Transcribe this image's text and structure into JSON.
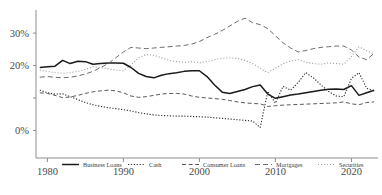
{
  "chart_data": {
    "type": "line",
    "title": "",
    "subtitle": "",
    "xlabel": "",
    "ylabel": "",
    "xlim": [
      1978.5,
      2023.5
    ],
    "ylim": [
      -8.5,
      36.5
    ],
    "grid": false,
    "legend_position": "bottom",
    "xticks": [
      1980,
      1990,
      2000,
      2010,
      2020
    ],
    "xticklabels": [
      "1980",
      "1990",
      "2000",
      "2010",
      "2020"
    ],
    "yticks": [
      0,
      10,
      20,
      30
    ],
    "yticklabels": [
      "0%",
      "",
      "20%",
      "30%"
    ],
    "x": [
      1979,
      1980,
      1981,
      1982,
      1983,
      1984,
      1985,
      1986,
      1987,
      1988,
      1989,
      1990,
      1991,
      1992,
      1993,
      1994,
      1995,
      1996,
      1997,
      1998,
      1999,
      2000,
      2001,
      2002,
      2003,
      2004,
      2005,
      2006,
      2007,
      2008,
      2009,
      2010,
      2011,
      2012,
      2013,
      2014,
      2015,
      2016,
      2017,
      2018,
      2019,
      2020,
      2021,
      2022,
      2023
    ],
    "series": [
      {
        "name": "Business Loans",
        "style": "solid",
        "color": "#1a1a1a",
        "values": [
          19.4,
          19.6,
          19.8,
          21.6,
          20.6,
          21.3,
          21.2,
          20.4,
          20.6,
          20.8,
          20.8,
          20.7,
          19.4,
          17.6,
          16.6,
          16.2,
          17.0,
          17.5,
          17.8,
          18.2,
          18.4,
          18.4,
          16.6,
          14.0,
          11.8,
          11.4,
          12.0,
          12.6,
          13.5,
          14.0,
          11.2,
          9.9,
          10.4,
          10.9,
          11.2,
          11.6,
          12.0,
          12.4,
          12.7,
          12.8,
          12.6,
          13.8,
          10.8,
          11.6,
          12.4
        ]
      },
      {
        "name": "Cash",
        "style": "dotted",
        "color": "#303030",
        "values": [
          12.4,
          11.6,
          11.2,
          11.3,
          10.4,
          9.5,
          8.6,
          7.9,
          7.4,
          7.0,
          6.7,
          6.4,
          6.0,
          5.5,
          5.1,
          4.8,
          4.6,
          4.5,
          4.4,
          4.4,
          4.3,
          4.2,
          4.1,
          3.9,
          3.7,
          3.5,
          3.3,
          3.1,
          2.9,
          0.9,
          12.0,
          8.4,
          13.6,
          12.4,
          14.8,
          17.8,
          16.2,
          14.0,
          12.0,
          10.6,
          10.4,
          16.0,
          17.8,
          13.0,
          12.2
        ]
      },
      {
        "name": "Consumer Loans",
        "style": "dashed",
        "color": "#5a5a5a",
        "values": [
          11.6,
          11.4,
          10.8,
          10.1,
          10.3,
          10.8,
          11.4,
          11.9,
          12.2,
          12.4,
          12.2,
          11.6,
          10.6,
          10.2,
          10.4,
          10.8,
          11.2,
          11.4,
          11.4,
          11.2,
          10.6,
          10.2,
          10.0,
          9.8,
          9.6,
          9.2,
          8.8,
          8.5,
          8.3,
          8.2,
          7.4,
          7.6,
          7.8,
          7.9,
          8.0,
          8.1,
          8.2,
          8.3,
          8.4,
          8.5,
          8.8,
          8.2,
          7.9,
          8.6,
          8.8
        ]
      },
      {
        "name": "Mortgages",
        "style": "longdash",
        "color": "#6b6b6b",
        "values": [
          16.4,
          16.6,
          16.4,
          16.2,
          16.4,
          16.8,
          17.4,
          18.2,
          19.4,
          20.6,
          22.4,
          24.2,
          25.6,
          25.4,
          25.2,
          25.4,
          25.6,
          25.8,
          26.0,
          26.2,
          26.6,
          27.4,
          28.6,
          29.6,
          30.8,
          32.2,
          33.6,
          34.6,
          33.2,
          32.6,
          31.4,
          29.2,
          27.0,
          25.4,
          24.2,
          24.6,
          25.2,
          25.6,
          25.8,
          26.0,
          26.0,
          24.8,
          22.6,
          21.8,
          23.8
        ]
      },
      {
        "name": "Securities",
        "style": "fine-dotted",
        "color": "#9a9a9a",
        "values": [
          18.6,
          18.2,
          17.8,
          17.6,
          17.8,
          18.2,
          18.8,
          19.6,
          19.4,
          19.0,
          18.6,
          18.4,
          20.2,
          22.4,
          23.4,
          23.2,
          22.4,
          21.6,
          21.2,
          21.0,
          21.2,
          20.8,
          21.2,
          21.8,
          22.2,
          22.4,
          22.2,
          21.6,
          20.6,
          19.2,
          17.8,
          19.2,
          20.6,
          21.4,
          21.8,
          21.0,
          20.6,
          20.4,
          20.8,
          20.6,
          20.4,
          22.8,
          25.8,
          24.6,
          23.6
        ]
      }
    ]
  },
  "legend": {
    "items": [
      {
        "label": "Business Loans",
        "style": "solid"
      },
      {
        "label": "Cash",
        "style": "dotted"
      },
      {
        "label": "Consumer Loans",
        "style": "dashed"
      },
      {
        "label": "Mortgages",
        "style": "longdash"
      },
      {
        "label": "Securities",
        "style": "fine-dotted"
      }
    ]
  }
}
